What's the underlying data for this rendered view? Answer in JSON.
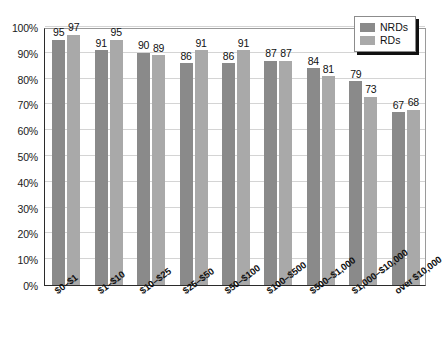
{
  "chart_data": {
    "type": "bar",
    "title": "",
    "subtitle": "",
    "xlabel": "",
    "ylabel": "",
    "ylim": [
      0,
      100
    ],
    "yticks": [
      "0%",
      "10%",
      "20%",
      "30%",
      "40%",
      "50%",
      "60%",
      "70%",
      "80%",
      "90%",
      "100%"
    ],
    "ytick_values": [
      0,
      10,
      20,
      30,
      40,
      50,
      60,
      70,
      80,
      90,
      100
    ],
    "grid": true,
    "legend_position": "top-right",
    "categories": [
      "$0–$1",
      "$1–$10",
      "$10–$25",
      "$25–$50",
      "$50–$100",
      "$100–$500",
      "$500–$1,000",
      "$1,000–$10,000",
      "over $10,000"
    ],
    "series": [
      {
        "name": "NRDs",
        "color": "#8a8a8a",
        "values": [
          95,
          91,
          90,
          86,
          86,
          87,
          84,
          79,
          67
        ]
      },
      {
        "name": "RDs",
        "color": "#a9a9a9",
        "values": [
          97,
          95,
          89,
          91,
          91,
          87,
          81,
          73,
          68
        ]
      }
    ]
  },
  "legend": {
    "items": [
      {
        "label": "NRDs",
        "swatch": "nrd"
      },
      {
        "label": "RDs",
        "swatch": "rd"
      }
    ]
  },
  "colors": {
    "nrd_bar": "#8a8a8a",
    "rd_bar": "#a9a9a9",
    "gridline": "#d4d4d4",
    "axis": "#2b2b2b",
    "plot_background": "#ffffff",
    "text": "#111111"
  }
}
